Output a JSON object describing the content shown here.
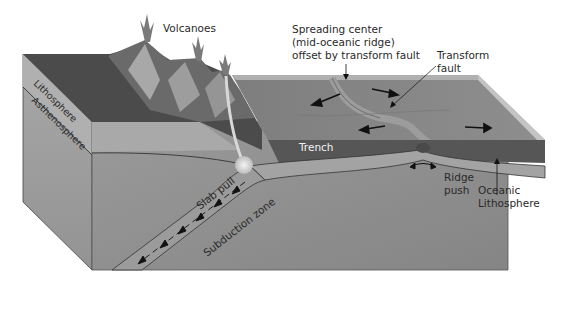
{
  "diagram": {
    "labels": {
      "volcanoes": "Volcanoes",
      "spreading_center": [
        "Spreading center",
        "(mid-oceanic ridge)",
        "offset by transform fault"
      ],
      "transform_fault": [
        "Transform",
        "fault"
      ],
      "lithosphere": "Lithosphere",
      "asthenosphere": "Asthenosphere",
      "trench": "Trench",
      "slab_pull": "Slab pull",
      "subduction_zone": "Subduction zone",
      "ridge_push": [
        "Ridge",
        "push"
      ],
      "oceanic_lithosphere": [
        "Oceanic",
        "Lithosphere"
      ]
    },
    "colors": {
      "continent_top": "#4a4a4a",
      "ocean_top": "#8a8a8a",
      "ocean_edge": "#bdbdbd",
      "lithosphere_face": "#a6a6a6",
      "asthenosphere_face": "#8f8f8f",
      "mantle_face": "#909090",
      "trench_band": "#555555",
      "slab": "#9a9a9a",
      "magma": "#e8e8e8"
    }
  }
}
